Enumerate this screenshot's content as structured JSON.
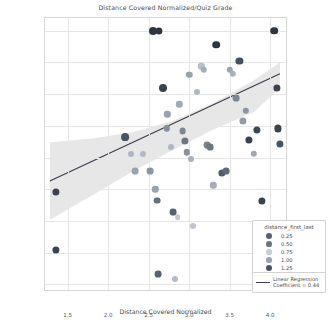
{
  "chart_data": {
    "type": "scatter",
    "title": "Distance Covered Normalized/Quiz Grade",
    "xlabel": "Distance Covered Normalized",
    "ylabel": "Quiz Grade",
    "xlim": [
      1.22,
      4.22
    ],
    "ylim": [
      -0.6,
      21.0
    ],
    "xticks": [
      "1.5",
      "2.0",
      "2.5",
      "3.0",
      "3.5",
      "4.0"
    ],
    "xtick_values": [
      1.5,
      2.0,
      2.5,
      3.0,
      3.5,
      4.0
    ],
    "yticks": [
      "0.0",
      "2.5",
      "5.0",
      "7.5",
      "10.0",
      "12.5",
      "15.0",
      "17.5",
      "20.0"
    ],
    "ytick_values": [
      0.0,
      2.5,
      5.0,
      7.5,
      10.0,
      12.5,
      15.0,
      17.5,
      20.0
    ],
    "grid": true,
    "legend_position": "lower right",
    "size_legend": {
      "title": "distance_first_last",
      "entries": [
        {
          "label": "0.25",
          "size": 4.0,
          "color": "#555f6e"
        },
        {
          "label": "0.50",
          "size": 3.6,
          "color": "#6b7686"
        },
        {
          "label": "0.75",
          "size": 3.2,
          "color": "#c9ced6"
        },
        {
          "label": "1.00",
          "size": 3.6,
          "color": "#9aa3af"
        },
        {
          "label": "1.25",
          "size": 4.2,
          "color": "#4a5461"
        }
      ]
    },
    "regression": {
      "label": "Linear Regression",
      "coefficient_label": "Coefficient = 0.44",
      "coefficient": 0.44,
      "x_start": 1.28,
      "y_start": 8.15,
      "x_end": 4.12,
      "y_end": 16.6,
      "band_color": "#d9d9d9",
      "line_color": "#3c3c4c"
    },
    "confidence_band": {
      "x": [
        1.28,
        1.8,
        2.3,
        2.8,
        3.3,
        3.8,
        4.12
      ],
      "upper": [
        11.2,
        11.5,
        12.0,
        12.9,
        14.3,
        16.1,
        17.5
      ],
      "lower": [
        5.1,
        7.0,
        8.9,
        10.6,
        12.2,
        13.6,
        15.5
      ]
    },
    "points": [
      {
        "x": 1.35,
        "y": 7.3,
        "size": 3.6,
        "color": "#3b424d"
      },
      {
        "x": 1.35,
        "y": 2.7,
        "size": 3.6,
        "color": "#3b424d"
      },
      {
        "x": 2.21,
        "y": 11.6,
        "size": 3.9,
        "color": "#4a5360"
      },
      {
        "x": 2.28,
        "y": 10.3,
        "size": 3.0,
        "color": "#aeb5bf"
      },
      {
        "x": 2.33,
        "y": 8.9,
        "size": 3.4,
        "color": "#9aa2ad"
      },
      {
        "x": 2.43,
        "y": 10.3,
        "size": 3.0,
        "color": "#b4bac3"
      },
      {
        "x": 2.52,
        "y": 8.9,
        "size": 3.4,
        "color": "#8d95a1"
      },
      {
        "x": 2.55,
        "y": 20.0,
        "size": 4.0,
        "color": "#2f353f"
      },
      {
        "x": 2.63,
        "y": 20.0,
        "size": 3.6,
        "color": "#2f353f"
      },
      {
        "x": 2.58,
        "y": 7.5,
        "size": 3.2,
        "color": "#9aa2ad"
      },
      {
        "x": 2.6,
        "y": 6.6,
        "size": 3.4,
        "color": "#676f7c"
      },
      {
        "x": 2.62,
        "y": 0.8,
        "size": 3.4,
        "color": "#5a626e"
      },
      {
        "x": 2.68,
        "y": 15.5,
        "size": 4.0,
        "color": "#3b424d"
      },
      {
        "x": 2.73,
        "y": 13.4,
        "size": 3.2,
        "color": "#9aa2ad"
      },
      {
        "x": 2.72,
        "y": 12.3,
        "size": 3.2,
        "color": "#868e9a"
      },
      {
        "x": 2.78,
        "y": 10.8,
        "size": 3.0,
        "color": "#b0b6c0"
      },
      {
        "x": 2.8,
        "y": 5.7,
        "size": 3.4,
        "color": "#596270"
      },
      {
        "x": 2.83,
        "y": 0.4,
        "size": 3.0,
        "color": "#b6bcc5"
      },
      {
        "x": 2.86,
        "y": 5.3,
        "size": 2.8,
        "color": "#c2c7ce"
      },
      {
        "x": 2.88,
        "y": 14.2,
        "size": 3.2,
        "color": "#a2a9b4"
      },
      {
        "x": 2.92,
        "y": 12.1,
        "size": 3.4,
        "color": "#7d8692"
      },
      {
        "x": 2.95,
        "y": 11.3,
        "size": 3.6,
        "color": "#6d7682"
      },
      {
        "x": 2.97,
        "y": 10.4,
        "size": 3.2,
        "color": "#8a929e"
      },
      {
        "x": 3.0,
        "y": 16.5,
        "size": 3.2,
        "color": "#9aa2ad"
      },
      {
        "x": 3.02,
        "y": 9.9,
        "size": 3.0,
        "color": "#aab1bb"
      },
      {
        "x": 3.05,
        "y": 4.6,
        "size": 3.0,
        "color": "#c0c5cc"
      },
      {
        "x": 3.1,
        "y": 15.2,
        "size": 3.0,
        "color": "#b2b8c1"
      },
      {
        "x": 3.15,
        "y": 17.2,
        "size": 3.2,
        "color": "#b8bdc6"
      },
      {
        "x": 3.18,
        "y": 16.9,
        "size": 3.2,
        "color": "#a6adb8"
      },
      {
        "x": 3.22,
        "y": 11.0,
        "size": 3.4,
        "color": "#7b838f"
      },
      {
        "x": 3.26,
        "y": 10.8,
        "size": 3.4,
        "color": "#6f7783"
      },
      {
        "x": 3.3,
        "y": 7.8,
        "size": 3.2,
        "color": "#a6adb8"
      },
      {
        "x": 3.33,
        "y": 18.9,
        "size": 3.8,
        "color": "#2f353f"
      },
      {
        "x": 3.4,
        "y": 8.8,
        "size": 3.6,
        "color": "#4f5866"
      },
      {
        "x": 3.46,
        "y": 8.9,
        "size": 3.4,
        "color": "#626a77"
      },
      {
        "x": 3.5,
        "y": 16.9,
        "size": 3.2,
        "color": "#9aa2ad"
      },
      {
        "x": 3.54,
        "y": 16.6,
        "size": 3.2,
        "color": "#aab1bb"
      },
      {
        "x": 3.58,
        "y": 14.7,
        "size": 3.4,
        "color": "#7d8692"
      },
      {
        "x": 3.62,
        "y": 17.6,
        "size": 3.6,
        "color": "#474f5c"
      },
      {
        "x": 3.66,
        "y": 12.9,
        "size": 3.6,
        "color": "#959ca8"
      },
      {
        "x": 3.7,
        "y": 13.7,
        "size": 3.2,
        "color": "#8d95a1"
      },
      {
        "x": 3.74,
        "y": 11.4,
        "size": 3.6,
        "color": "#3b424d"
      },
      {
        "x": 3.8,
        "y": 10.3,
        "size": 3.2,
        "color": "#a2a9b4"
      },
      {
        "x": 3.84,
        "y": 12.2,
        "size": 3.6,
        "color": "#3f4653"
      },
      {
        "x": 3.9,
        "y": 6.6,
        "size": 3.6,
        "color": "#3b424d"
      },
      {
        "x": 4.05,
        "y": 20.0,
        "size": 3.8,
        "color": "#2f353f"
      },
      {
        "x": 4.08,
        "y": 15.5,
        "size": 3.6,
        "color": "#3b424d"
      },
      {
        "x": 4.1,
        "y": 12.3,
        "size": 3.6,
        "color": "#3b424d"
      },
      {
        "x": 4.12,
        "y": 11.1,
        "size": 3.6,
        "color": "#4a5360"
      }
    ]
  }
}
